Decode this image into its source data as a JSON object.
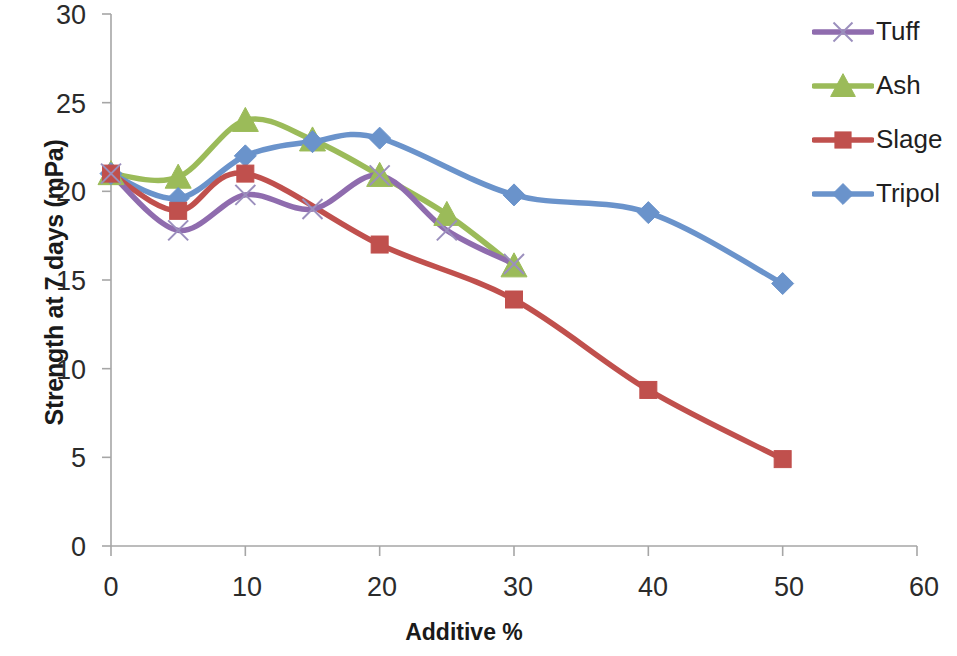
{
  "chart_data": {
    "type": "line",
    "title": "",
    "xlabel": "Additive  %",
    "ylabel": "Strength at 7 days (mPa)",
    "xlim": [
      0,
      60
    ],
    "ylim": [
      0,
      30
    ],
    "xticks": [
      "0",
      "10",
      "20",
      "30",
      "40",
      "50",
      "60"
    ],
    "yticks": [
      "0",
      "5",
      "10",
      "15",
      "20",
      "25",
      "30"
    ],
    "grid": false,
    "legend_position": "right",
    "series": [
      {
        "name": "Tuff",
        "color": "#8f6cae",
        "marker": "x",
        "x": [
          0,
          5,
          10,
          15,
          20,
          25,
          30
        ],
        "values": [
          21.0,
          17.8,
          19.8,
          19.0,
          20.9,
          17.8,
          15.9
        ]
      },
      {
        "name": "Ash",
        "color": "#9bbb59",
        "marker": "triangle",
        "x": [
          0,
          5,
          10,
          15,
          20,
          25,
          30
        ],
        "values": [
          21.0,
          20.8,
          24.0,
          22.9,
          20.9,
          18.7,
          15.8
        ]
      },
      {
        "name": "Slage",
        "color": "#c0504d",
        "marker": "square",
        "x": [
          0,
          5,
          10,
          20,
          30,
          40,
          50
        ],
        "values": [
          21.0,
          18.9,
          21.0,
          17.0,
          13.9,
          8.8,
          4.9
        ]
      },
      {
        "name": "Tripol",
        "color": "#6a93cb",
        "marker": "diamond",
        "x": [
          0,
          5,
          10,
          15,
          20,
          30,
          40,
          50
        ],
        "values": [
          21.0,
          19.6,
          22.0,
          22.8,
          23.0,
          19.8,
          18.8,
          14.8
        ]
      }
    ]
  },
  "legend": {
    "entries": [
      {
        "label": "Tuff"
      },
      {
        "label": "Ash"
      },
      {
        "label": "Slage"
      },
      {
        "label": "Tripol"
      }
    ]
  },
  "axes": {
    "y_title": "Strength at 7 days (mPa)",
    "x_title": "Additive  %",
    "axis_color": "#a6a6a6"
  }
}
